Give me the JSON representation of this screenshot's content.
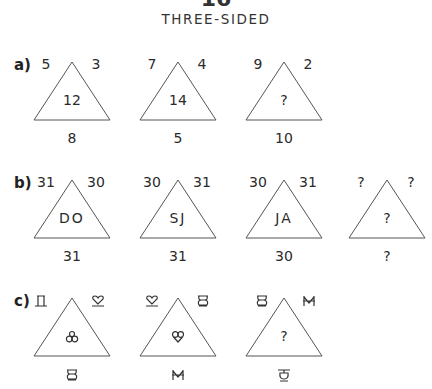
{
  "header": {
    "puzzle_number": "16",
    "title": "THREE-SIDED"
  },
  "rows": [
    {
      "label": "a)",
      "triangles": [
        {
          "top_left": "5",
          "top_right": "3",
          "center": "12",
          "bottom": "8"
        },
        {
          "top_left": "7",
          "top_right": "4",
          "center": "14",
          "bottom": "5"
        },
        {
          "top_left": "9",
          "top_right": "2",
          "center": "?",
          "bottom": "10"
        }
      ]
    },
    {
      "label": "b)",
      "triangles": [
        {
          "top_left": "31",
          "top_right": "30",
          "center": "DO",
          "bottom": "31"
        },
        {
          "top_left": "30",
          "top_right": "31",
          "center": "SJ",
          "bottom": "31"
        },
        {
          "top_left": "30",
          "top_right": "31",
          "center": "JA",
          "bottom": "30"
        },
        {
          "top_left": "?",
          "top_right": "?",
          "center": "?",
          "bottom": "?"
        }
      ]
    },
    {
      "label": "c)",
      "triangles": [
        {
          "top_left": "pi-glyph",
          "top_right": "heart-glyph",
          "center": "trefoil-glyph",
          "bottom": "eight-glyph"
        },
        {
          "top_left": "heart-glyph",
          "top_right": "eight-glyph",
          "center": "nine-glyph",
          "bottom": "m-glyph"
        },
        {
          "top_left": "eight-glyph",
          "top_right": "m-glyph",
          "center": "?",
          "bottom": "five-glyph"
        }
      ]
    }
  ],
  "colors": {
    "line": "#555555",
    "text": "#2a2a2a",
    "background": "#ffffff"
  }
}
